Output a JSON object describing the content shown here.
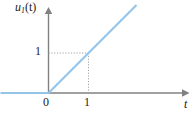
{
  "figure": {
    "name": "unit-ramp-function-plot",
    "background_color": "#ffffff",
    "axis_color": "#808080",
    "curve_color": "#92c5e8",
    "grid_color": "#b3b3b3",
    "text_color": "#1a1a1a"
  },
  "labels": {
    "y_axis": "u",
    "y_axis_subscript": "1",
    "y_axis_arg": "(t)",
    "x_axis": "t",
    "origin": "0",
    "x_tick_1": "1",
    "y_tick_1": "1"
  },
  "chart_data": {
    "type": "line",
    "title": "",
    "xlabel": "t",
    "ylabel": "u₁(t)",
    "xlim": [
      -1.2,
      3.2
    ],
    "ylim": [
      -0.25,
      2.15
    ],
    "grid": false,
    "legend": null,
    "series": [
      {
        "name": "u₁(t)",
        "color": "#92c5e8",
        "points": [
          {
            "x": -1.2,
            "y": 0
          },
          {
            "x": 0,
            "y": 0
          },
          {
            "x": 1,
            "y": 1
          },
          {
            "x": 2.2,
            "y": 2.2
          }
        ]
      }
    ],
    "annotations": [
      {
        "name": "guide-horizontal",
        "style": "dotted",
        "from": {
          "x": 0,
          "y": 1
        },
        "to": {
          "x": 1,
          "y": 1
        }
      },
      {
        "name": "guide-vertical",
        "style": "dotted",
        "from": {
          "x": 1,
          "y": 1
        },
        "to": {
          "x": 1,
          "y": 0
        }
      }
    ],
    "xticks": [
      {
        "value": 0,
        "label": "0"
      },
      {
        "value": 1,
        "label": "1"
      }
    ],
    "yticks": [
      {
        "value": 1,
        "label": "1"
      }
    ]
  }
}
